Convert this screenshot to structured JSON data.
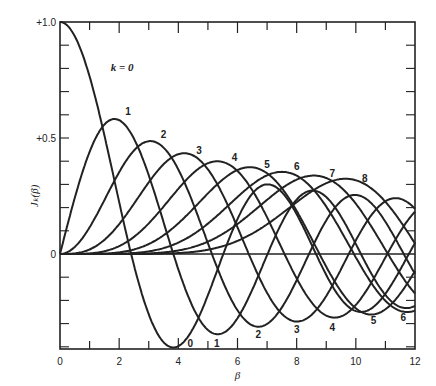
{
  "chart_data": {
    "type": "line",
    "title": "",
    "xlabel": "β",
    "ylabel": "J_k(β)",
    "xlim": [
      0,
      12
    ],
    "ylim": [
      -0.41,
      1.0
    ],
    "xticks": [
      0,
      2,
      4,
      6,
      8,
      10,
      12
    ],
    "yticks": [
      {
        "v": 1.0,
        "label": "+1.0"
      },
      {
        "v": 0.5,
        "label": "+0.5"
      },
      {
        "v": 0,
        "label": "0"
      }
    ],
    "grid": false,
    "series": [
      {
        "name": "k = 0",
        "order": 0
      },
      {
        "name": "1",
        "order": 1
      },
      {
        "name": "2",
        "order": 2
      },
      {
        "name": "3",
        "order": 3
      },
      {
        "name": "4",
        "order": 4
      },
      {
        "name": "5",
        "order": 5
      },
      {
        "name": "6",
        "order": 6
      },
      {
        "name": "7",
        "order": 7
      },
      {
        "name": "8",
        "order": 8
      }
    ],
    "annotations": [
      {
        "text": "k = 0",
        "x": 2.1,
        "y": 0.79
      },
      {
        "text": "1",
        "x": 2.3,
        "y": 0.6
      },
      {
        "text": "2",
        "x": 3.5,
        "y": 0.5
      },
      {
        "text": "3",
        "x": 4.7,
        "y": 0.43
      },
      {
        "text": "4",
        "x": 5.9,
        "y": 0.4
      },
      {
        "text": "5",
        "x": 7.0,
        "y": 0.37
      },
      {
        "text": "6",
        "x": 8.0,
        "y": 0.36
      },
      {
        "text": "7",
        "x": 9.2,
        "y": 0.33
      },
      {
        "text": "8",
        "x": 10.3,
        "y": 0.31
      },
      {
        "text": "0",
        "x": 4.4,
        "y": -0.4
      },
      {
        "text": "1",
        "x": 5.3,
        "y": -0.4
      },
      {
        "text": "2",
        "x": 6.7,
        "y": -0.36
      },
      {
        "text": "3",
        "x": 8.0,
        "y": -0.34
      },
      {
        "text": "4",
        "x": 9.2,
        "y": -0.33
      },
      {
        "text": "5",
        "x": 10.6,
        "y": -0.3
      },
      {
        "text": "6",
        "x": 11.6,
        "y": -0.29
      }
    ]
  }
}
